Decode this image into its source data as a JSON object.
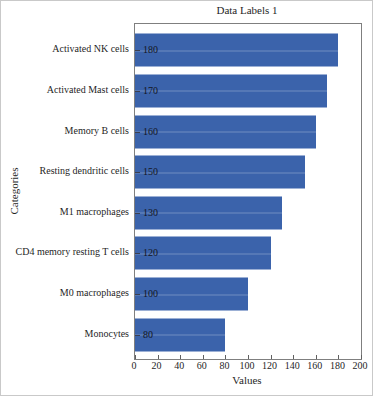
{
  "chart_data": {
    "type": "bar",
    "orientation": "horizontal",
    "title": "Data Labels 1",
    "xlabel": "Values",
    "ylabel": "Categories",
    "categories": [
      "Activated NK cells",
      "Activated Mast cells",
      "Memory B cells",
      "Resting dendritic cells",
      "M1 macrophages",
      "CD4 memory resting T cells",
      "M0 macrophages",
      "Monocytes"
    ],
    "values": [
      180,
      170,
      160,
      150,
      130,
      120,
      100,
      80
    ],
    "data_labels": [
      "180",
      "170",
      "160",
      "150",
      "130",
      "120",
      "100",
      "80"
    ],
    "xlim": [
      0,
      200
    ],
    "xticks": [
      0,
      20,
      40,
      60,
      80,
      100,
      120,
      140,
      160,
      180,
      200
    ],
    "legend": null,
    "grid": false,
    "bar_color": "#3b63ab",
    "axis_color": "#7f7f7f",
    "text_color": "#262626"
  }
}
